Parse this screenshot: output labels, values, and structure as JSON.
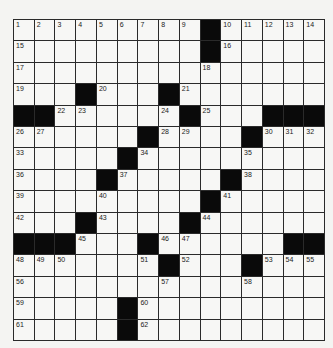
{
  "puzzle": {
    "rows": 15,
    "cols": 15,
    "colors": {
      "black_square": "#0a0a0a",
      "white_square": "#f7f7f5",
      "grid_line": "#2a2a2a"
    },
    "black_squares": [
      [
        0,
        9
      ],
      [
        1,
        9
      ],
      [
        3,
        3
      ],
      [
        3,
        7
      ],
      [
        4,
        0
      ],
      [
        4,
        1
      ],
      [
        4,
        8
      ],
      [
        4,
        12
      ],
      [
        4,
        13
      ],
      [
        4,
        14
      ],
      [
        5,
        6
      ],
      [
        5,
        11
      ],
      [
        6,
        5
      ],
      [
        7,
        4
      ],
      [
        7,
        10
      ],
      [
        8,
        9
      ],
      [
        9,
        3
      ],
      [
        9,
        8
      ],
      [
        10,
        0
      ],
      [
        10,
        1
      ],
      [
        10,
        2
      ],
      [
        10,
        6
      ],
      [
        10,
        13
      ],
      [
        10,
        14
      ],
      [
        11,
        7
      ],
      [
        11,
        11
      ],
      [
        13,
        5
      ],
      [
        14,
        5
      ]
    ],
    "clue_numbers": [
      {
        "n": "1",
        "r": 0,
        "c": 0
      },
      {
        "n": "2",
        "r": 0,
        "c": 1
      },
      {
        "n": "3",
        "r": 0,
        "c": 2
      },
      {
        "n": "4",
        "r": 0,
        "c": 3
      },
      {
        "n": "5",
        "r": 0,
        "c": 4
      },
      {
        "n": "6",
        "r": 0,
        "c": 5
      },
      {
        "n": "7",
        "r": 0,
        "c": 6
      },
      {
        "n": "8",
        "r": 0,
        "c": 7
      },
      {
        "n": "9",
        "r": 0,
        "c": 8
      },
      {
        "n": "10",
        "r": 0,
        "c": 10
      },
      {
        "n": "11",
        "r": 0,
        "c": 11
      },
      {
        "n": "12",
        "r": 0,
        "c": 12
      },
      {
        "n": "13",
        "r": 0,
        "c": 13
      },
      {
        "n": "14",
        "r": 0,
        "c": 14
      },
      {
        "n": "15",
        "r": 1,
        "c": 0
      },
      {
        "n": "16",
        "r": 1,
        "c": 10
      },
      {
        "n": "17",
        "r": 2,
        "c": 0
      },
      {
        "n": "18",
        "r": 2,
        "c": 9
      },
      {
        "n": "19",
        "r": 3,
        "c": 0
      },
      {
        "n": "20",
        "r": 3,
        "c": 4
      },
      {
        "n": "21",
        "r": 3,
        "c": 8
      },
      {
        "n": "22",
        "r": 4,
        "c": 2
      },
      {
        "n": "23",
        "r": 4,
        "c": 3
      },
      {
        "n": "24",
        "r": 4,
        "c": 7
      },
      {
        "n": "25",
        "r": 4,
        "c": 9
      },
      {
        "n": "26",
        "r": 5,
        "c": 0
      },
      {
        "n": "27",
        "r": 5,
        "c": 1
      },
      {
        "n": "28",
        "r": 5,
        "c": 7
      },
      {
        "n": "29",
        "r": 5,
        "c": 8
      },
      {
        "n": "30",
        "r": 5,
        "c": 12
      },
      {
        "n": "31",
        "r": 5,
        "c": 13
      },
      {
        "n": "32",
        "r": 5,
        "c": 14
      },
      {
        "n": "33",
        "r": 6,
        "c": 0
      },
      {
        "n": "34",
        "r": 6,
        "c": 6
      },
      {
        "n": "35",
        "r": 6,
        "c": 11
      },
      {
        "n": "36",
        "r": 7,
        "c": 0
      },
      {
        "n": "37",
        "r": 7,
        "c": 5
      },
      {
        "n": "38",
        "r": 7,
        "c": 11
      },
      {
        "n": "39",
        "r": 8,
        "c": 0
      },
      {
        "n": "40",
        "r": 8,
        "c": 4
      },
      {
        "n": "41",
        "r": 8,
        "c": 10
      },
      {
        "n": "42",
        "r": 9,
        "c": 0
      },
      {
        "n": "43",
        "r": 9,
        "c": 4
      },
      {
        "n": "44",
        "r": 9,
        "c": 9
      },
      {
        "n": "45",
        "r": 10,
        "c": 3
      },
      {
        "n": "46",
        "r": 10,
        "c": 7
      },
      {
        "n": "47",
        "r": 10,
        "c": 8
      },
      {
        "n": "48",
        "r": 11,
        "c": 0
      },
      {
        "n": "49",
        "r": 11,
        "c": 1
      },
      {
        "n": "50",
        "r": 11,
        "c": 2
      },
      {
        "n": "51",
        "r": 11,
        "c": 6
      },
      {
        "n": "52",
        "r": 11,
        "c": 8
      },
      {
        "n": "53",
        "r": 11,
        "c": 12
      },
      {
        "n": "54",
        "r": 11,
        "c": 13
      },
      {
        "n": "55",
        "r": 11,
        "c": 14
      },
      {
        "n": "56",
        "r": 12,
        "c": 0
      },
      {
        "n": "57",
        "r": 12,
        "c": 7
      },
      {
        "n": "58",
        "r": 12,
        "c": 11
      },
      {
        "n": "59",
        "r": 13,
        "c": 0
      },
      {
        "n": "60",
        "r": 13,
        "c": 6
      },
      {
        "n": "61",
        "r": 14,
        "c": 0
      },
      {
        "n": "62",
        "r": 14,
        "c": 6
      }
    ]
  }
}
